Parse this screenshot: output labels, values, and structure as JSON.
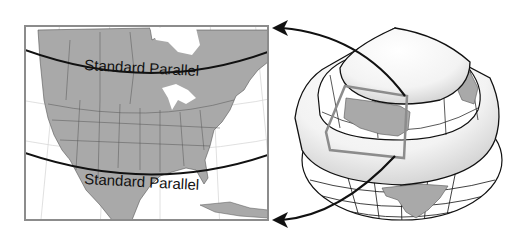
{
  "figure": {
    "type": "map-projection-diagram",
    "map_panel": {
      "region": "North America",
      "parallel_labels": [
        "Standard Parallel",
        "Standard Parallel"
      ],
      "land_color": "#a9a9a9",
      "water_color": "#ffffff",
      "frame_color": "#8c8c8c"
    },
    "globe_panel": {
      "element": "globe with secant cone",
      "cone_surface_color": "#f2f2f2",
      "highlight_box_color": "#8c8c8c"
    },
    "arrows": [
      {
        "from": "globe-upper-parallel",
        "to": "map-top-right"
      },
      {
        "from": "globe-lower-parallel",
        "to": "map-bottom-right"
      }
    ],
    "colors": {
      "line": "#111111",
      "grid": "#d8d8d8",
      "land": "#a9a9a9"
    }
  }
}
